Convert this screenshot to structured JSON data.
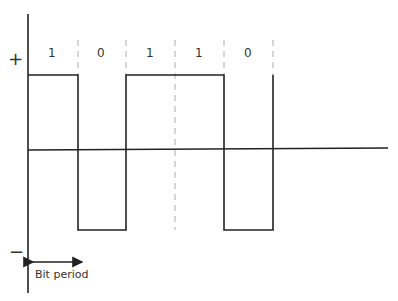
{
  "diagram": {
    "type": "bipolar NRZ signal waveform",
    "bits": [
      "1",
      "0",
      "1",
      "1",
      "0"
    ],
    "levels": {
      "positive_label": "+",
      "negative_label": "−"
    },
    "annotation": {
      "bit_period_label": "Bit period"
    },
    "colors": {
      "line": "#222222",
      "dashed": "#bbbbbb",
      "text": "#333333"
    }
  }
}
